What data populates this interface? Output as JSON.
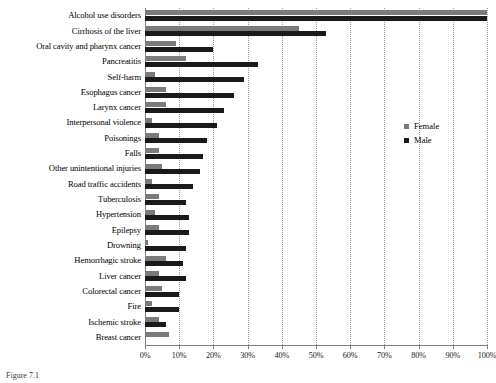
{
  "chart_data": {
    "type": "bar",
    "orientation": "horizontal",
    "title": "",
    "xlabel": "",
    "ylabel": "",
    "xlim": [
      0,
      100
    ],
    "xtick_labels": [
      "0%",
      "10%",
      "20%",
      "30%",
      "40%",
      "50%",
      "60%",
      "70%",
      "80%",
      "90%",
      "100%"
    ],
    "xtick_values": [
      0,
      10,
      20,
      30,
      40,
      50,
      60,
      70,
      80,
      90,
      100
    ],
    "grid": true,
    "legend_position": "right",
    "categories": [
      "Alcohol use disorders",
      "Cirrhosis of the liver",
      "Oral cavity and pharynx cancer",
      "Pancreatitis",
      "Self-harm",
      "Esophagus cancer",
      "Larynx cancer",
      "Interpersonal violence",
      "Poisonings",
      "Falls",
      "Other unintentional injuries",
      "Road traffic accidents",
      "Tuberculosis",
      "Hypertension",
      "Epilepsy",
      "Drowning",
      "Hemorrhagic stroke",
      "Liver cancer",
      "Colorectal cancer",
      "Fire",
      "Ischemic stroke",
      "Breast cancer"
    ],
    "series": [
      {
        "name": "Female",
        "color": "#7b7b7b",
        "values": [
          100,
          45,
          9,
          12,
          3,
          6,
          6,
          2,
          4,
          4,
          5,
          2,
          4,
          3,
          4,
          1,
          6,
          4,
          5,
          2,
          4,
          7
        ]
      },
      {
        "name": "Male",
        "color": "#1a1a1a",
        "values": [
          100,
          53,
          20,
          33,
          29,
          26,
          23,
          21,
          18,
          17,
          16,
          14,
          12,
          13,
          13,
          12,
          11,
          12,
          10,
          10,
          6,
          0
        ]
      }
    ]
  },
  "legend": {
    "items": [
      {
        "label": "Female",
        "swatch": "female-swatch-icon"
      },
      {
        "label": "Male",
        "swatch": "male-swatch-icon"
      }
    ]
  },
  "caption": {
    "text": "Figure 7.1"
  }
}
